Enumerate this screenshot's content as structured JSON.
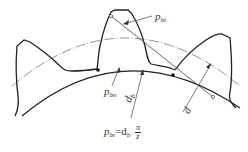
{
  "figure": {
    "colors": {
      "profile": "#222222",
      "thin": "#555555",
      "background": "#ffffff"
    },
    "labels": {
      "pbt_top": {
        "main": "p",
        "sub": "bt"
      },
      "pbn": {
        "main": "p",
        "sub": "bn"
      },
      "db": {
        "main": "d",
        "sub": "b"
      },
      "d": {
        "main": "d"
      },
      "formula": {
        "lhs_main": "p",
        "lhs_sub": "bt",
        "eq": "=d",
        "eq_sub": "b",
        "num": "π",
        "den": "z"
      }
    },
    "elements": [
      "gear-tooth-profiles",
      "base-circle",
      "pitch-circle-dash-dot",
      "tangent-line",
      "diameter-d-arrow",
      "base-diameter-db-line"
    ]
  }
}
